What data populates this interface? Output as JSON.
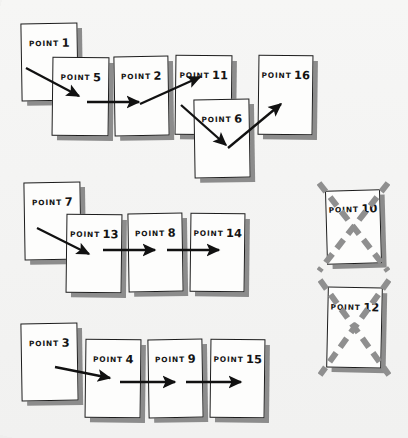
{
  "canvas": {
    "width": 408,
    "height": 438,
    "background_color": "#f4f4f3",
    "card_fill_color": "#fdfdfc",
    "card_border_color": "#1c1c1c",
    "card_shadow_color": "#8c8c8c",
    "arrow_color": "#111111",
    "cross_color": "#8f8f8f"
  },
  "cards": [
    {
      "id": "point-1",
      "word": "POINT",
      "number": "1",
      "x": 21,
      "y": 23,
      "w": 57,
      "h": 78,
      "tilt": "tilt-a",
      "crossed": false
    },
    {
      "id": "point-5",
      "word": "POINT",
      "number": "5",
      "x": 52,
      "y": 57,
      "w": 57,
      "h": 79,
      "tilt": "tilt-b",
      "crossed": false
    },
    {
      "id": "point-2",
      "word": "POINT",
      "number": "2",
      "x": 114,
      "y": 56,
      "w": 55,
      "h": 80,
      "tilt": "tilt-a",
      "crossed": false
    },
    {
      "id": "point-11",
      "word": "POINT",
      "number": "11",
      "x": 175,
      "y": 55,
      "w": 57,
      "h": 80,
      "tilt": "tilt-b",
      "crossed": false
    },
    {
      "id": "point-6",
      "word": "POINT",
      "number": "6",
      "x": 194,
      "y": 99,
      "w": 56,
      "h": 79,
      "tilt": "tilt-a",
      "crossed": false
    },
    {
      "id": "point-16",
      "word": "POINT",
      "number": "16",
      "x": 258,
      "y": 55,
      "w": 55,
      "h": 80,
      "tilt": "tilt-b",
      "crossed": false
    },
    {
      "id": "point-7",
      "word": "POINT",
      "number": "7",
      "x": 24,
      "y": 182,
      "w": 57,
      "h": 78,
      "tilt": "tilt-a",
      "crossed": false
    },
    {
      "id": "point-13",
      "word": "POINT",
      "number": "13",
      "x": 66,
      "y": 214,
      "w": 56,
      "h": 79,
      "tilt": "tilt-b",
      "crossed": false
    },
    {
      "id": "point-8",
      "word": "POINT",
      "number": "8",
      "x": 128,
      "y": 213,
      "w": 55,
      "h": 79,
      "tilt": "tilt-a",
      "crossed": false
    },
    {
      "id": "point-14",
      "word": "POINT",
      "number": "14",
      "x": 190,
      "y": 213,
      "w": 55,
      "h": 79,
      "tilt": "tilt-b",
      "crossed": false
    },
    {
      "id": "point-10",
      "word": "POINT",
      "number": "10",
      "x": 326,
      "y": 190,
      "w": 55,
      "h": 74,
      "tilt": "tilt-c",
      "crossed": true
    },
    {
      "id": "point-12",
      "word": "POINT",
      "number": "12",
      "x": 327,
      "y": 287,
      "w": 55,
      "h": 81,
      "tilt": "tilt-d",
      "crossed": true
    },
    {
      "id": "point-3",
      "word": "POINT",
      "number": "3",
      "x": 21,
      "y": 323,
      "w": 57,
      "h": 78,
      "tilt": "tilt-a",
      "crossed": false
    },
    {
      "id": "point-4",
      "word": "POINT",
      "number": "4",
      "x": 85,
      "y": 339,
      "w": 56,
      "h": 79,
      "tilt": "tilt-b",
      "crossed": false
    },
    {
      "id": "point-9",
      "word": "POINT",
      "number": "9",
      "x": 148,
      "y": 339,
      "w": 55,
      "h": 79,
      "tilt": "tilt-a",
      "crossed": false
    },
    {
      "id": "point-15",
      "word": "POINT",
      "number": "15",
      "x": 210,
      "y": 339,
      "w": 55,
      "h": 79,
      "tilt": "tilt-b",
      "crossed": false
    }
  ],
  "arrows": [
    {
      "id": "arrow-1-to-5",
      "from": "point-1",
      "to": "point-5",
      "x1": 26,
      "y1": 68,
      "x2": 79,
      "y2": 96
    },
    {
      "id": "arrow-5-to-2",
      "from": "point-5",
      "to": "point-2",
      "x1": 87,
      "y1": 102,
      "x2": 139,
      "y2": 102
    },
    {
      "id": "arrow-2-to-11",
      "from": "point-2",
      "to": "point-11",
      "x1": 140,
      "y1": 104,
      "x2": 200,
      "y2": 77
    },
    {
      "id": "arrow-11-to-6",
      "from": "point-11",
      "to": "point-6",
      "x1": 181,
      "y1": 105,
      "x2": 226,
      "y2": 145
    },
    {
      "id": "arrow-6-to-16",
      "from": "point-6",
      "to": "point-16",
      "x1": 228,
      "y1": 148,
      "x2": 281,
      "y2": 104
    },
    {
      "id": "arrow-7-to-13",
      "from": "point-7",
      "to": "point-13",
      "x1": 37,
      "y1": 228,
      "x2": 89,
      "y2": 254
    },
    {
      "id": "arrow-13-to-8",
      "from": "point-13",
      "to": "point-8",
      "x1": 103,
      "y1": 250,
      "x2": 155,
      "y2": 250
    },
    {
      "id": "arrow-8-to-14",
      "from": "point-8",
      "to": "point-14",
      "x1": 167,
      "y1": 250,
      "x2": 219,
      "y2": 250
    },
    {
      "id": "arrow-3-to-4",
      "from": "point-3",
      "to": "point-4",
      "x1": 55,
      "y1": 367,
      "x2": 110,
      "y2": 378
    },
    {
      "id": "arrow-4-to-9",
      "from": "point-4",
      "to": "point-9",
      "x1": 120,
      "y1": 382,
      "x2": 175,
      "y2": 382
    },
    {
      "id": "arrow-9-to-15",
      "from": "point-9",
      "to": "point-15",
      "x1": 186,
      "y1": 382,
      "x2": 241,
      "y2": 382
    }
  ],
  "groups": [
    {
      "id": "row-1-chain",
      "sequence": [
        "POINT 1",
        "POINT 5",
        "POINT 2",
        "POINT 11",
        "POINT 6",
        "POINT 16"
      ]
    },
    {
      "id": "row-2-chain",
      "sequence": [
        "POINT 7",
        "POINT 13",
        "POINT 8",
        "POINT 14"
      ]
    },
    {
      "id": "row-2-crossed",
      "sequence": [
        "POINT 10"
      ]
    },
    {
      "id": "row-3-chain",
      "sequence": [
        "POINT 3",
        "POINT 4",
        "POINT 9",
        "POINT 15"
      ]
    },
    {
      "id": "row-3-crossed",
      "sequence": [
        "POINT 12"
      ]
    }
  ]
}
